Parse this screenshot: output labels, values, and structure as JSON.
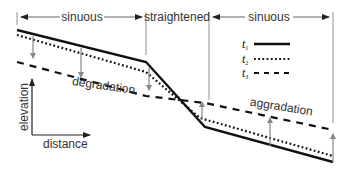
{
  "diagram": {
    "title": "",
    "segments": [
      {
        "label": "sinuous",
        "x_start": 17,
        "x_end": 146
      },
      {
        "label": "straightened",
        "x_start": 146,
        "x_end": 209
      },
      {
        "label": "sinuous",
        "x_start": 209,
        "x_end": 333
      }
    ],
    "legend": [
      {
        "label": "t",
        "subscript": "1",
        "style": "solid"
      },
      {
        "label": "t",
        "subscript": "2",
        "style": "dotted"
      },
      {
        "label": "t",
        "subscript": "3",
        "style": "dashed"
      }
    ],
    "annotations": {
      "degradation": "degradation",
      "aggradation": "aggradation"
    },
    "axes": {
      "y_label": "elevation",
      "x_label": "distance"
    },
    "profiles": {
      "t1": [
        [
          17,
          30
        ],
        [
          146,
          62
        ],
        [
          205,
          127
        ],
        [
          333,
          162
        ]
      ],
      "t2": [
        [
          17,
          35
        ],
        [
          146,
          72
        ],
        [
          200,
          118
        ],
        [
          333,
          156
        ]
      ],
      "t3": [
        [
          17,
          62
        ],
        [
          146,
          96
        ],
        [
          333,
          130
        ]
      ]
    },
    "colors": {
      "line": "#111111",
      "arrow": "#888888",
      "text": "#333333"
    }
  }
}
